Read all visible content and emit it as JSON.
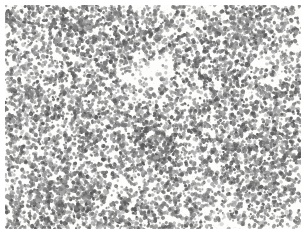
{
  "image": {
    "kind": "micrograph-texture",
    "description": "Dense monochrome particulate micrograph texture on white paper",
    "width": 308,
    "height": 238,
    "background_color": "#fdfdfc",
    "paper_color": "#ffffff"
  },
  "margins": {
    "top": 5,
    "right": 7,
    "bottom": 9,
    "left": 5
  },
  "particles": {
    "count": 9000,
    "min_radius": 0.9,
    "max_radius": 2.1,
    "color_dark": "#585858",
    "color_mid": "#7b7b7b",
    "color_light": "#a2a2a2",
    "opacity_min": 0.45,
    "opacity_max": 0.95,
    "seed": 20240607
  },
  "density_field": {
    "base": 0.72,
    "note": "Multiplicative density modifiers applied over the base particle field",
    "voids": [
      {
        "name": "bottom-right-dome",
        "cx": 232,
        "cy": 243,
        "rx": 36,
        "ry": 30,
        "strength": 1.0
      },
      {
        "name": "upper-center-clearing",
        "cx": 152,
        "cy": 72,
        "rx": 34,
        "ry": 20,
        "strength": 0.78
      },
      {
        "name": "mid-left-clearing",
        "cx": 58,
        "cy": 128,
        "rx": 17,
        "ry": 13,
        "strength": 0.5
      },
      {
        "name": "upper-left-gap",
        "cx": 30,
        "cy": 44,
        "rx": 13,
        "ry": 10,
        "strength": 0.42
      },
      {
        "name": "center-gap",
        "cx": 196,
        "cy": 96,
        "rx": 14,
        "ry": 11,
        "strength": 0.44
      },
      {
        "name": "lower-center-gap",
        "cx": 122,
        "cy": 186,
        "rx": 15,
        "ry": 11,
        "strength": 0.4
      },
      {
        "name": "right-upper-gap",
        "cx": 266,
        "cy": 60,
        "rx": 12,
        "ry": 10,
        "strength": 0.38
      },
      {
        "name": "left-lower-gap",
        "cx": 24,
        "cy": 196,
        "rx": 12,
        "ry": 9,
        "strength": 0.36
      }
    ],
    "clusters": [
      {
        "name": "right-dense-band",
        "cx": 252,
        "cy": 140,
        "rx": 46,
        "ry": 56,
        "strength": 0.38
      },
      {
        "name": "lower-left-dense",
        "cx": 66,
        "cy": 196,
        "rx": 52,
        "ry": 30,
        "strength": 0.34
      },
      {
        "name": "upper-right-dense",
        "cx": 236,
        "cy": 36,
        "rx": 44,
        "ry": 26,
        "strength": 0.26
      },
      {
        "name": "mid-center-dense",
        "cx": 150,
        "cy": 140,
        "rx": 40,
        "ry": 30,
        "strength": 0.22
      },
      {
        "name": "left-mid-dense",
        "cx": 30,
        "cy": 112,
        "rx": 26,
        "ry": 34,
        "strength": 0.2
      },
      {
        "name": "top-left-dense",
        "cx": 78,
        "cy": 28,
        "rx": 36,
        "ry": 20,
        "strength": 0.2
      }
    ]
  },
  "speckle": {
    "count": 520,
    "color": "#b4b4b4",
    "opacity_min": 0.15,
    "opacity_max": 0.45,
    "radius": 0.55
  },
  "grain": {
    "count": 1700,
    "color": "#cfcfcf",
    "opacity": 0.3
  }
}
